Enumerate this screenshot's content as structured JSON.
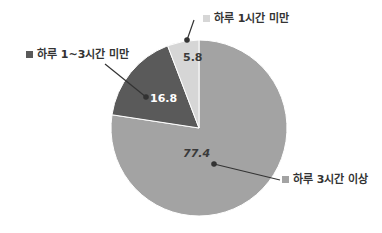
{
  "chart_data": {
    "type": "pie",
    "title": "",
    "unit": "%",
    "slices": [
      {
        "label": "하루 3시간 이상",
        "value": 77.4,
        "color": "#a3a3a3",
        "value_color": "#3a3a3a"
      },
      {
        "label": "하루 1~3시간 미만",
        "value": 16.8,
        "color": "#5a5a5a",
        "value_color": "#ffffff"
      },
      {
        "label": "하루 1시간 미만",
        "value": 5.8,
        "color": "#d6d6d6",
        "value_color": "#3a3a3a"
      }
    ],
    "legend_position": "callouts"
  },
  "labels": {
    "s0": "하루 3시간 이상",
    "s1": "하루 1~3시간 미만",
    "s2": "하루 1시간 미만",
    "v0": "77.4",
    "v1": "16.8",
    "v2": "5.8",
    "marker": "■"
  }
}
